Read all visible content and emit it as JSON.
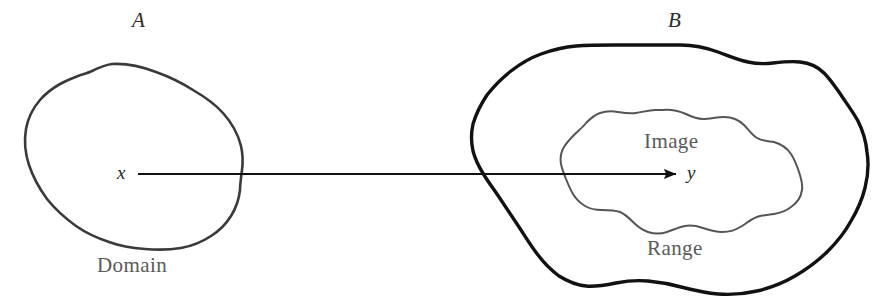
{
  "diagram": {
    "type": "set-mapping-diagram",
    "background_color": "#ffffff"
  },
  "sets": {
    "source": {
      "label": "A",
      "caption": "Domain",
      "outline_color": "#3a3a3a",
      "outline_width": 2.6
    },
    "target": {
      "label": "B",
      "caption": "Range",
      "outline_color": "#111111",
      "outline_width": 3.4
    },
    "subset": {
      "caption": "Image",
      "outline_color": "#555555",
      "outline_width": 2.0
    }
  },
  "points": {
    "source_point": "x",
    "target_point": "y"
  },
  "arrow": {
    "color": "#111111",
    "width": 2.0,
    "from_x": 138,
    "to_x": 676,
    "y": 174
  },
  "icons": {
    "arrowhead": "arrowhead-icon",
    "blob_source": "blob-outline-icon",
    "blob_target": "blob-outline-icon",
    "blob_subset": "blob-outline-icon"
  }
}
